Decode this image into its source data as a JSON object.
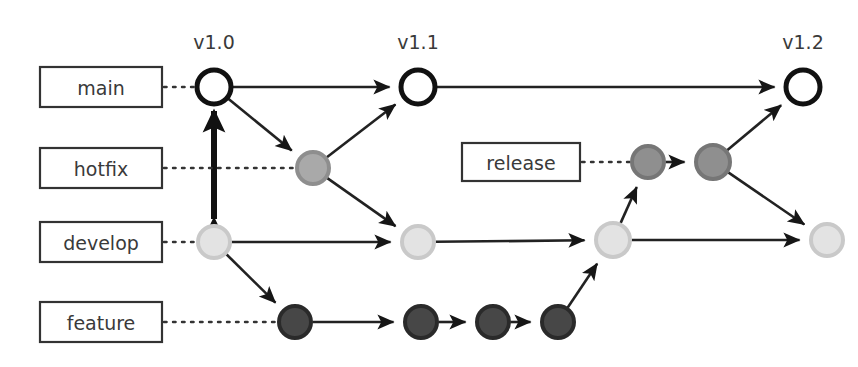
{
  "diagram": {
    "width": 858,
    "height": 367,
    "background": "#ffffff"
  },
  "version_tags": [
    {
      "id": "v10",
      "label": "v1.0",
      "x": 214,
      "y": 42
    },
    {
      "id": "v11",
      "label": "v1.1",
      "x": 418,
      "y": 42
    },
    {
      "id": "v12",
      "label": "v1.2",
      "x": 803,
      "y": 42
    }
  ],
  "branch_labels": [
    {
      "id": "main",
      "label": "main",
      "box_x": 40,
      "box_y": 67,
      "box_w": 122,
      "box_h": 40,
      "dot_to_x": 214,
      "row_y": 87
    },
    {
      "id": "hotfix",
      "label": "hotfix",
      "box_x": 40,
      "box_y": 148,
      "box_w": 122,
      "box_h": 40,
      "dot_to_x": 313,
      "row_y": 168
    },
    {
      "id": "develop",
      "label": "develop",
      "box_x": 40,
      "box_y": 222,
      "box_w": 122,
      "box_h": 40,
      "dot_to_x": 214,
      "row_y": 242
    },
    {
      "id": "feature",
      "label": "feature",
      "box_x": 40,
      "box_y": 302,
      "box_w": 122,
      "box_h": 40,
      "dot_to_x": 295,
      "row_y": 322
    },
    {
      "id": "release",
      "label": "release",
      "box_x": 462,
      "box_y": 143,
      "box_w": 118,
      "box_h": 38,
      "dot_to_x": 648,
      "row_y": 162
    }
  ],
  "colors": {
    "main_node_fill": "#ffffff",
    "main_node_stroke": "#111111",
    "hotfix_node_fill": "#a9a9a9",
    "hotfix_node_stroke": "#8e8e8e",
    "develop_node_fill": "#e3e3e3",
    "develop_node_stroke": "#c9c9c9",
    "feature_node_fill": "#474747",
    "feature_node_stroke": "#2a2a2a",
    "release_node_fill": "#8f8f8f",
    "release_node_stroke": "#767676",
    "edge": "#222222",
    "text": "#3a3a3a",
    "box_border": "#333333"
  },
  "nodes": [
    {
      "id": "main-v10",
      "branch": "main",
      "x": 214,
      "y": 87,
      "r": 17,
      "style": "open",
      "tag": "v1.0"
    },
    {
      "id": "main-v11",
      "branch": "main",
      "x": 418,
      "y": 87,
      "r": 17,
      "style": "open",
      "tag": "v1.1"
    },
    {
      "id": "main-v12",
      "branch": "main",
      "x": 803,
      "y": 87,
      "r": 17,
      "style": "open",
      "tag": "v1.2"
    },
    {
      "id": "hotfix-1",
      "branch": "hotfix",
      "x": 313,
      "y": 168,
      "r": 16,
      "style": "filled",
      "tag": ""
    },
    {
      "id": "release-1",
      "branch": "release",
      "x": 648,
      "y": 162,
      "r": 16,
      "style": "filled",
      "tag": ""
    },
    {
      "id": "release-2",
      "branch": "release",
      "x": 713,
      "y": 162,
      "r": 17,
      "style": "filled",
      "tag": ""
    },
    {
      "id": "develop-1",
      "branch": "develop",
      "x": 214,
      "y": 242,
      "r": 16,
      "style": "filled",
      "tag": ""
    },
    {
      "id": "develop-2",
      "branch": "develop",
      "x": 418,
      "y": 242,
      "r": 16,
      "style": "filled",
      "tag": ""
    },
    {
      "id": "develop-3",
      "branch": "develop",
      "x": 613,
      "y": 240,
      "r": 17,
      "style": "filled",
      "tag": ""
    },
    {
      "id": "develop-4",
      "branch": "develop",
      "x": 827,
      "y": 240,
      "r": 16,
      "style": "filled",
      "tag": ""
    },
    {
      "id": "feature-1",
      "branch": "feature",
      "x": 295,
      "y": 322,
      "r": 16,
      "style": "filled",
      "tag": ""
    },
    {
      "id": "feature-2",
      "branch": "feature",
      "x": 421,
      "y": 322,
      "r": 16,
      "style": "filled",
      "tag": ""
    },
    {
      "id": "feature-3",
      "branch": "feature",
      "x": 493,
      "y": 322,
      "r": 16,
      "style": "filled",
      "tag": ""
    },
    {
      "id": "feature-4",
      "branch": "feature",
      "x": 558,
      "y": 322,
      "r": 16,
      "style": "filled",
      "tag": ""
    }
  ],
  "edges": [
    {
      "id": "e-main10-main11",
      "from": "main-v10",
      "to": "main-v11",
      "kind": "arrow"
    },
    {
      "id": "e-main11-main12",
      "from": "main-v11",
      "to": "main-v12",
      "kind": "arrow"
    },
    {
      "id": "e-main10-hotfix1",
      "from": "main-v10",
      "to": "hotfix-1",
      "kind": "arrow"
    },
    {
      "id": "e-hotfix1-main11",
      "from": "hotfix-1",
      "to": "main-v11",
      "kind": "arrow"
    },
    {
      "id": "e-hotfix1-develop2",
      "from": "hotfix-1",
      "to": "develop-2",
      "kind": "arrow"
    },
    {
      "id": "e-develop1-main10",
      "from": "develop-1",
      "to": "main-v10",
      "kind": "double-arrow-thick"
    },
    {
      "id": "e-develop1-develop2",
      "from": "develop-1",
      "to": "develop-2",
      "kind": "arrow"
    },
    {
      "id": "e-develop1-feature1",
      "from": "develop-1",
      "to": "feature-1",
      "kind": "arrow"
    },
    {
      "id": "e-develop2-develop3",
      "from": "develop-2",
      "to": "develop-3",
      "kind": "arrow"
    },
    {
      "id": "e-develop3-release1",
      "from": "develop-3",
      "to": "release-1",
      "kind": "arrow"
    },
    {
      "id": "e-develop3-develop4",
      "from": "develop-3",
      "to": "develop-4",
      "kind": "arrow"
    },
    {
      "id": "e-release1-release2",
      "from": "release-1",
      "to": "release-2",
      "kind": "arrow"
    },
    {
      "id": "e-release2-main12",
      "from": "release-2",
      "to": "main-v12",
      "kind": "arrow"
    },
    {
      "id": "e-release2-develop4",
      "from": "release-2",
      "to": "develop-4",
      "kind": "arrow"
    },
    {
      "id": "e-feature1-feature2",
      "from": "feature-1",
      "to": "feature-2",
      "kind": "arrow"
    },
    {
      "id": "e-feature2-feature3",
      "from": "feature-2",
      "to": "feature-3",
      "kind": "arrow"
    },
    {
      "id": "e-feature3-feature4",
      "from": "feature-3",
      "to": "feature-4",
      "kind": "arrow"
    },
    {
      "id": "e-feature4-develop3",
      "from": "feature-4",
      "to": "develop-3",
      "kind": "arrow"
    }
  ]
}
